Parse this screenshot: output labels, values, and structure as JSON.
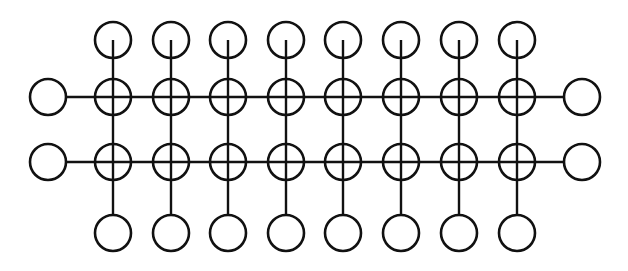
{
  "diagram": {
    "type": "grid-network",
    "stroke_color": "#111111",
    "background": "#ffffff",
    "node_radius": 18,
    "columns_x": [
      113,
      171,
      228,
      286,
      343,
      401,
      459,
      517
    ],
    "rows_y": [
      97,
      162
    ],
    "top_node_y": 40,
    "bottom_node_y": 233,
    "left_node_x": 48,
    "right_node_x": 582,
    "counts": {
      "columns": 8,
      "rows": 2,
      "crossing_nodes": 16,
      "top_nodes": 8,
      "bottom_nodes": 8,
      "left_end_nodes": 2,
      "right_end_nodes": 2
    }
  }
}
